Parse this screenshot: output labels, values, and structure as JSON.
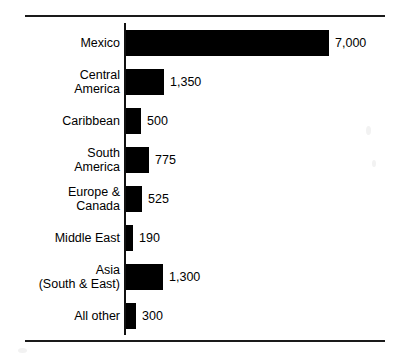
{
  "chart_data": {
    "type": "bar",
    "orientation": "horizontal",
    "title": "",
    "subtitle": "",
    "xlabel": "",
    "ylabel": "",
    "grid": false,
    "legend": null,
    "xlim": [
      0,
      7000
    ],
    "axis_origin": 0,
    "categories": [
      "Mexico",
      "Central\nAmerica",
      "Caribbean",
      "South\nAmerica",
      "Europe &\nCanada",
      "Middle East",
      "Asia\n(South & East)",
      "All other"
    ],
    "values": [
      7000,
      1350,
      500,
      775,
      525,
      190,
      1300,
      300
    ],
    "value_labels": [
      "7,000",
      "1,350",
      "500",
      "775",
      "525",
      "190",
      "1,300",
      "300"
    ],
    "bar_color": "#000000",
    "background_color": "#ffffff",
    "axis_color": "#111111",
    "rule_color": "#1a1a1a"
  },
  "rows": [
    {
      "label": "Mexico",
      "value": 7000,
      "value_label": "7,000",
      "bar_px": 203,
      "top_px": 6
    },
    {
      "label": "Central\nAmerica",
      "value": 1350,
      "value_label": "1,350",
      "bar_px": 38,
      "top_px": 45
    },
    {
      "label": "Caribbean",
      "value": 500,
      "value_label": "500",
      "bar_px": 15,
      "top_px": 84
    },
    {
      "label": "South\nAmerica",
      "value": 775,
      "value_label": "775",
      "bar_px": 23,
      "top_px": 123
    },
    {
      "label": "Europe &\nCanada",
      "value": 525,
      "value_label": "525",
      "bar_px": 16,
      "top_px": 162
    },
    {
      "label": "Middle East",
      "value": 190,
      "value_label": "190",
      "bar_px": 7,
      "top_px": 201
    },
    {
      "label": "Asia\n(South & East)",
      "value": 1300,
      "value_label": "1,300",
      "bar_px": 37,
      "top_px": 240
    },
    {
      "label": "All other",
      "value": 300,
      "value_label": "300",
      "bar_px": 10,
      "top_px": 279
    }
  ]
}
